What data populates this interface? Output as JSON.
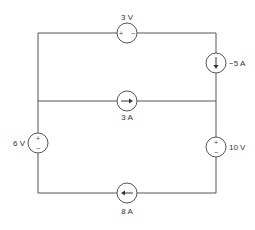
{
  "diagram": {
    "type": "circuit",
    "sources": {
      "top_voltage": {
        "label": "3 V",
        "kind": "voltage",
        "polarity": "+ -",
        "orientation": "horizontal"
      },
      "right_current_top": {
        "label": "−5 A",
        "kind": "current",
        "direction": "down"
      },
      "middle_current": {
        "label": "3 A",
        "kind": "current",
        "direction": "right"
      },
      "left_voltage": {
        "label": "6 V",
        "kind": "voltage",
        "polarity_top": "+",
        "polarity_bottom": "−"
      },
      "right_voltage": {
        "label": "10 V",
        "kind": "voltage",
        "polarity_top": "+",
        "polarity_bottom": "−"
      },
      "bottom_current": {
        "label": "8 A",
        "kind": "current",
        "direction": "left"
      }
    },
    "signs": {
      "plus": "+",
      "minus": "−"
    }
  }
}
